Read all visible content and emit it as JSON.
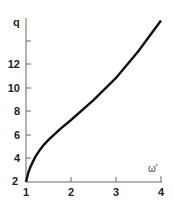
{
  "chart_data": {
    "type": "line",
    "title": "",
    "xlabel": "ω'",
    "ylabel": "q",
    "xlim": [
      1,
      4
    ],
    "ylim": [
      2,
      16
    ],
    "x_ticks": [
      "1",
      "2",
      "3",
      "4"
    ],
    "y_ticks": [
      "2",
      "4",
      "6",
      "8",
      "10",
      "12",
      ""
    ],
    "grid": false,
    "legend": null,
    "series": [
      {
        "name": "q(ω')",
        "x": [
          1.0,
          1.05,
          1.1,
          1.2,
          1.3,
          1.4,
          1.5,
          1.75,
          2.0,
          2.5,
          3.0,
          3.5,
          4.0
        ],
        "values": [
          2.0,
          2.8,
          3.3,
          4.1,
          4.7,
          5.2,
          5.6,
          6.5,
          7.3,
          9.0,
          10.9,
          13.2,
          15.8
        ]
      }
    ]
  },
  "labels": {
    "ylabel": "q",
    "xlabel": "ω'",
    "xt1": "1",
    "xt2": "2",
    "xt3": "3",
    "xt4": "4",
    "yt2": "2",
    "yt4": "4",
    "yt6": "6",
    "yt8": "8",
    "yt10": "10",
    "yt12": "12"
  }
}
